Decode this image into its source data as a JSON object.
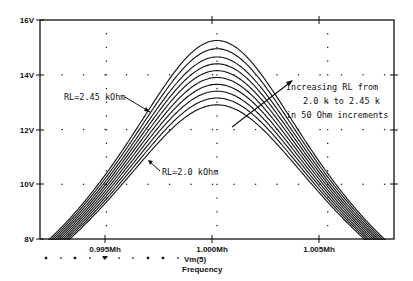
{
  "chart_data": {
    "type": "line",
    "title": "",
    "xlabel": "Frequency",
    "ylabel": "",
    "xlim": [
      0.992,
      1.008
    ],
    "ylim": [
      8,
      16
    ],
    "grid": "dotted",
    "x_ticks": [
      {
        "value": 0.995,
        "label": "0.995Mh"
      },
      {
        "value": 1.0,
        "label": "1.000Mh"
      },
      {
        "value": 1.005,
        "label": "1.005Mh"
      }
    ],
    "y_ticks": [
      {
        "value": 8,
        "label": "8V"
      },
      {
        "value": 10,
        "label": "10V"
      },
      {
        "value": 12,
        "label": "12V"
      },
      {
        "value": 14,
        "label": "14V"
      },
      {
        "value": 16,
        "label": "16V"
      }
    ],
    "legend": {
      "symbols": "dotted marker row",
      "label": "Vm(5)",
      "position": "bottom-left below axis"
    },
    "center_frequency": 1.0,
    "series": [
      {
        "name": "RL=2.00 kOhm",
        "peak": 12.9,
        "half_width_at_8V": 0.007
      },
      {
        "name": "RL=2.05 kOhm",
        "peak": 13.15,
        "half_width_at_8V": 0.0071
      },
      {
        "name": "RL=2.10 kOhm",
        "peak": 13.4,
        "half_width_at_8V": 0.0072
      },
      {
        "name": "RL=2.15 kOhm",
        "peak": 13.65,
        "half_width_at_8V": 0.0073
      },
      {
        "name": "RL=2.20 kOhm",
        "peak": 13.9,
        "half_width_at_8V": 0.0074
      },
      {
        "name": "RL=2.25 kOhm",
        "peak": 14.15,
        "half_width_at_8V": 0.0075
      },
      {
        "name": "RL=2.30 kOhm",
        "peak": 14.4,
        "half_width_at_8V": 0.0076
      },
      {
        "name": "RL=2.35 kOhm",
        "peak": 14.65,
        "half_width_at_8V": 0.0077
      },
      {
        "name": "RL=2.40 kOhm",
        "peak": 14.95,
        "half_width_at_8V": 0.0078
      },
      {
        "name": "RL=2.45 kOhm",
        "peak": 15.25,
        "half_width_at_8V": 0.0079
      }
    ],
    "annotations": [
      {
        "text": "RL=2.45 kOhm",
        "points_to": "top curve, left flank"
      },
      {
        "text": "RL=2.0 kOhm",
        "points_to": "bottom curve, left flank"
      },
      {
        "text": "Increasing RL from",
        "block": "arrow-note"
      },
      {
        "text": "2.0 k to 2.45 k",
        "block": "arrow-note"
      },
      {
        "text": "in 50 Ohm increments",
        "block": "arrow-note"
      }
    ]
  },
  "labels": {
    "y16": "16V",
    "y14": "14V",
    "y12": "12V",
    "y10": "10V",
    "y8": "8V",
    "x0995": "0.995Mh",
    "x1000": "1.000Mh",
    "x1005": "1.005Mh",
    "legend_series": "Vm(5)",
    "xlabel": "Frequency",
    "anno_top": "RL=2.45 kOhm",
    "anno_bottom": "RL=2.0 kOhm",
    "note_line1": "Increasing RL from",
    "note_line2": "2.0 k to 2.45 k",
    "note_line3": "in 50 Ohm increments"
  }
}
